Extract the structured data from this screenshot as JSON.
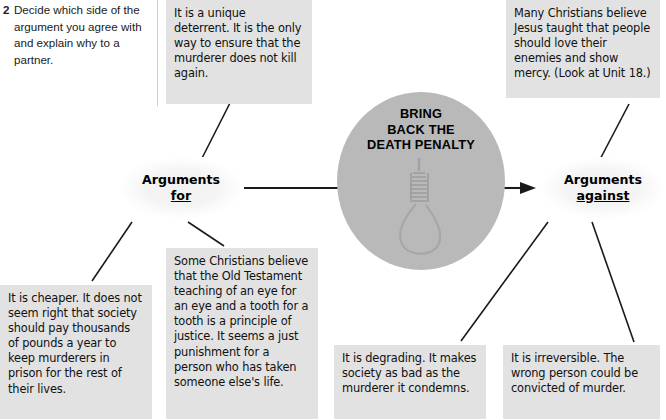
{
  "page": {
    "type": "mind-map",
    "background_color": "#ffffff",
    "note_color": "#e2e2e2",
    "oval_color": "#b9b9b9",
    "text_color": "#111111"
  },
  "task": {
    "number": "2",
    "text": "Decide which side of the argument you agree with and explain why to a partner."
  },
  "center": {
    "title_line_1": "BRING",
    "title_line_2": "BACK THE",
    "title_line_3": "DEATH PENALTY",
    "icon": "noose-icon"
  },
  "nodes": {
    "for": {
      "label": "Arguments",
      "emphasis": "for"
    },
    "against": {
      "label": "Arguments",
      "emphasis": "against"
    }
  },
  "notes": {
    "deterrent": "It is a unique deterrent. It is the only way to ensure that the murderer does not kill again.",
    "christians": "Many Christians believe Jesus taught that people should love their enemies and show mercy. (Look at Unit 18.)",
    "cheaper": "It is cheaper. It does not seem right that society should pay thousands of pounds a year to keep murderers in prison for the rest of their lives.",
    "old_testament": "Some Christians believe that the Old Testament teaching of an eye for an eye and a tooth for a tooth is a principle of justice. It seems a just punishment for a person who has taken someone else's life.",
    "degrading": "It is degrading. It makes society as bad as the murderer it condemns.",
    "irreversible": "It is irreversible. The wrong person could be convicted of murder."
  }
}
